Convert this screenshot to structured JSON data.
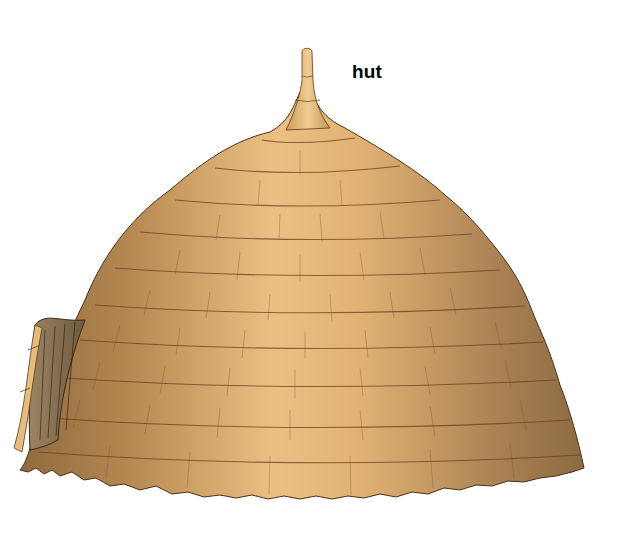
{
  "diagram": {
    "labels": [
      {
        "text": "hut",
        "target": "hut"
      }
    ]
  },
  "colors": {
    "background": "#ffffff",
    "thatch_light": "#e8b97a",
    "thatch_mid": "#c9975a",
    "thatch_dark": "#8a6236",
    "thatch_line": "#6b3f22",
    "entrance_shadow": "#7a6346",
    "entrance_rim": "#e6bd7e",
    "label_text": "#000000"
  }
}
